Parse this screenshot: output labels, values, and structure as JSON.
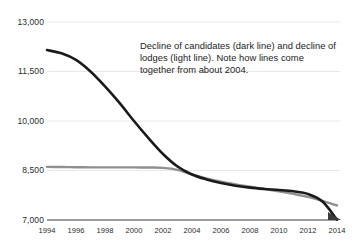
{
  "chart_data": {
    "type": "line",
    "title": "",
    "subtitle": "",
    "xlabel": "",
    "ylabel": "",
    "xlim": [
      1994,
      2014
    ],
    "ylim": [
      7000,
      13000
    ],
    "grid": true,
    "legend_position": "none",
    "annotation": "Decline of candidates (dark line) and decline of lodges (light line). Note how lines come together from about 2004.",
    "x": [
      1994,
      1995,
      1996,
      1997,
      1998,
      1999,
      2000,
      2001,
      2002,
      2003,
      2004,
      2005,
      2006,
      2007,
      2008,
      2009,
      2010,
      2011,
      2012,
      2013,
      2014
    ],
    "y_ticks": [
      7000,
      8500,
      10000,
      11500,
      13000
    ],
    "y_tick_labels": [
      "7,000",
      "8,500",
      "10,000",
      "11,500",
      "13,000"
    ],
    "x_ticks": [
      1994,
      1996,
      1998,
      2000,
      2002,
      2004,
      2006,
      2008,
      2010,
      2012,
      2014
    ],
    "x_tick_labels": [
      "1994",
      "1996",
      "1998",
      "2000",
      "2002",
      "2004",
      "2006",
      "2008",
      "2010",
      "2012",
      "2014"
    ],
    "series": [
      {
        "name": "Candidates",
        "style": "dark line",
        "color": "#1a1a1a",
        "width": 2.6,
        "values": [
          12150,
          12050,
          11850,
          11500,
          11050,
          10550,
          10000,
          9480,
          9000,
          8620,
          8380,
          8230,
          8120,
          8040,
          7980,
          7940,
          7910,
          7870,
          7790,
          7560,
          7010
        ]
      },
      {
        "name": "Lodges",
        "style": "light line",
        "color": "#8f8f8f",
        "width": 2.4,
        "values": [
          8610,
          8605,
          8600,
          8595,
          8595,
          8595,
          8595,
          8590,
          8580,
          8520,
          8380,
          8260,
          8160,
          8080,
          8010,
          7940,
          7870,
          7790,
          7700,
          7580,
          7440
        ]
      }
    ]
  },
  "axis": {
    "baseline_color": "#3a3a3a",
    "gridline_color": "#e8e8e8",
    "arrow": "arrow-right"
  },
  "colors": {
    "background": "#ffffff",
    "dark_line": "#1a1a1a",
    "light_line": "#8f8f8f",
    "text": "#1c1c1c"
  }
}
